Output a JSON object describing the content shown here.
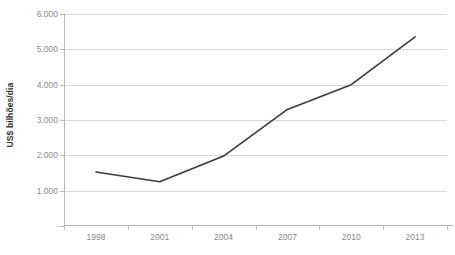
{
  "chart_data": {
    "type": "line",
    "title": "",
    "xlabel": "",
    "ylabel": "US$ bilhões/dia",
    "categories": [
      "1998",
      "2001",
      "2004",
      "2007",
      "2010",
      "2013"
    ],
    "values": [
      1.53,
      1.25,
      1.98,
      3.3,
      4.0,
      5.35
    ],
    "series": [
      {
        "name": "US$ bilhões/dia",
        "values": [
          1.53,
          1.25,
          1.98,
          3.3,
          4.0,
          5.35
        ]
      }
    ],
    "ylim": [
      0,
      6
    ],
    "y_ticks": [
      0,
      1,
      2,
      3,
      4,
      5,
      6
    ],
    "y_tick_labels": [
      "-",
      "1.000",
      "2.000",
      "3.000",
      "4.000",
      "5.000",
      "6.000"
    ],
    "x_tick_labels": [
      "1998",
      "2001",
      "2004",
      "2007",
      "2010",
      "2013"
    ],
    "grid": true,
    "legend": false,
    "legend_position": "none",
    "line_color": "#3a3a3a",
    "gridline_color": "#d6d6d6",
    "axis_color": "#b5b5b5",
    "tick_label_color": "#8a8a8a",
    "axis_title_color": "#2f2f2f",
    "background_color": "#ffffff",
    "markers": false
  }
}
